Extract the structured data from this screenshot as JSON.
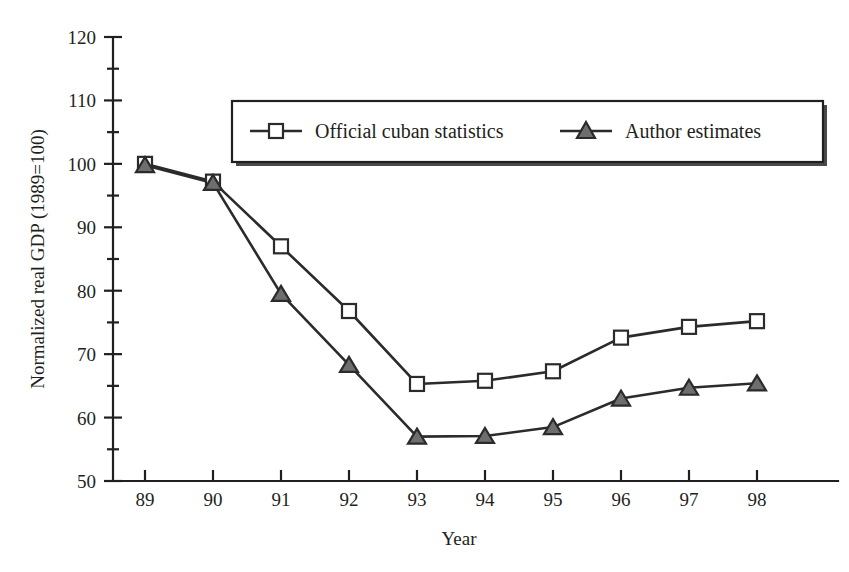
{
  "chart_data": {
    "type": "line",
    "title": "",
    "xlabel": "Year",
    "ylabel": "Normalized  real GDP (1989=100)",
    "x": [
      "89",
      "90",
      "91",
      "92",
      "93",
      "94",
      "95",
      "96",
      "97",
      "98"
    ],
    "categories": [
      "89",
      "90",
      "91",
      "92",
      "93",
      "94",
      "95",
      "96",
      "97",
      "98"
    ],
    "xlim": [
      89,
      98
    ],
    "ylim": [
      50,
      120
    ],
    "y_ticks_major": [
      50,
      60,
      70,
      80,
      90,
      100,
      110,
      120
    ],
    "y_ticks_minor": [
      55,
      65,
      75,
      85,
      95,
      105,
      115
    ],
    "grid": false,
    "legend_position": "top-center",
    "series": [
      {
        "name": "Official cuban statistics",
        "marker": "open-square",
        "color": "#2b2b2b",
        "values": [
          100.0,
          97.2,
          87.0,
          76.8,
          65.3,
          65.8,
          67.3,
          72.6,
          74.3,
          75.2
        ]
      },
      {
        "name": "Author estimates",
        "marker": "filled-triangle",
        "color": "#6e6e6e",
        "values": [
          99.8,
          97.0,
          79.5,
          68.3,
          57.0,
          57.1,
          58.5,
          63.0,
          64.7,
          65.4
        ]
      }
    ]
  },
  "axes": {
    "y_tick_labels": [
      "120",
      "110",
      "100",
      "90",
      "80",
      "70",
      "60",
      "50"
    ],
    "x_tick_labels": [
      "89",
      "90",
      "91",
      "92",
      "93",
      "94",
      "95",
      "96",
      "97",
      "98"
    ],
    "y_axis_title": "Normalized  real GDP (1989=100)",
    "x_axis_title": "Year"
  },
  "legend": {
    "entries": [
      {
        "label": "Official cuban statistics",
        "marker": "open-square"
      },
      {
        "label": "Author estimates",
        "marker": "filled-triangle"
      }
    ]
  },
  "colors": {
    "ink": "#231f20",
    "line": "#2b2b2b",
    "triangle_fill": "#6e6e6e",
    "background": "#ffffff"
  }
}
